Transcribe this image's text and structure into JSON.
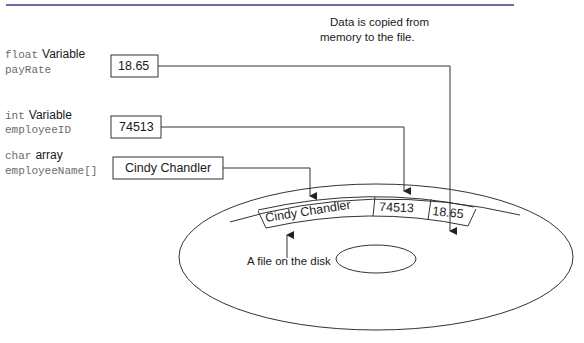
{
  "caption": {
    "line1": "Data is copied from",
    "line2": "memory to the file."
  },
  "variables": [
    {
      "type_keyword": "float",
      "type_word": "Variable",
      "name": "payRate",
      "value": "18.65"
    },
    {
      "type_keyword": "int",
      "type_word": "Variable",
      "name": "employeeID",
      "value": "74513"
    },
    {
      "type_keyword": "char",
      "type_word": "array",
      "name": "employeeName[]",
      "value": "Cindy Chandler"
    }
  ],
  "file_record": {
    "fields": [
      "Cindy Chandler",
      "74513",
      "18.65"
    ]
  },
  "disk": {
    "label": "A file on the disk"
  },
  "colors": {
    "rule": "#6e6aa8",
    "stroke": "#333333",
    "mono_text": "#6b6b6b"
  }
}
